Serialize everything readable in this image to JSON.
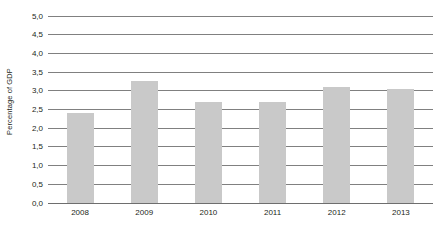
{
  "chart_data": {
    "type": "bar",
    "title": "",
    "subtitle": "",
    "xlabel": "",
    "ylabel": "Percentage of GDP",
    "categories": [
      "2008",
      "2009",
      "2010",
      "2011",
      "2012",
      "2013"
    ],
    "values": [
      2.4,
      3.25,
      2.7,
      2.7,
      3.1,
      3.05
    ],
    "series": [
      {
        "name": "Percentage of GDP",
        "values": [
          2.4,
          3.25,
          2.7,
          2.7,
          3.1,
          3.05
        ]
      }
    ],
    "ylim": [
      0.0,
      5.0
    ],
    "ytick_step": 0.5,
    "ytick_labels": [
      "0,0",
      "0,5",
      "1,0",
      "1,5",
      "2,0",
      "2,5",
      "3,0",
      "3,5",
      "4,0",
      "4,5",
      "5,0"
    ],
    "ytick_values": [
      0.0,
      0.5,
      1.0,
      1.5,
      2.0,
      2.5,
      3.0,
      3.5,
      4.0,
      4.5,
      5.0
    ],
    "decimal_separator": ",",
    "grid": "horizontal",
    "legend": "none",
    "legend_position": "",
    "bar_color": "#c9c9c9",
    "gridline_color": "#808080",
    "text_color": "#231f20",
    "background_color": "#ffffff",
    "annotations": []
  }
}
